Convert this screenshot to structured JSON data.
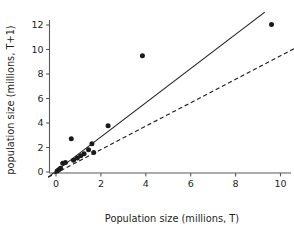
{
  "chart_data": {
    "type": "scatter",
    "title": "",
    "xlabel": "Population size (millions, T)",
    "ylabel": "population size (millions, T+1)",
    "xlim": [
      -0.6,
      10.9
    ],
    "ylim": [
      -0.7,
      13.2
    ],
    "xticks": [
      0,
      2,
      4,
      6,
      8,
      10
    ],
    "xtick_labels": [
      "0",
      "2",
      "4",
      "6",
      "8",
      "10"
    ],
    "yticks": [
      0,
      2,
      4,
      6,
      8,
      10,
      12
    ],
    "ytick_labels": [
      "0",
      "2",
      "4",
      "6",
      "8",
      "10",
      "12"
    ],
    "grid": false,
    "legend": "none",
    "points": [
      {
        "x": 0.05,
        "y": 0.08
      },
      {
        "x": 0.12,
        "y": 0.18
      },
      {
        "x": 0.2,
        "y": 0.3
      },
      {
        "x": 0.3,
        "y": 0.72
      },
      {
        "x": 0.42,
        "y": 0.78
      },
      {
        "x": 0.68,
        "y": 2.72
      },
      {
        "x": 0.78,
        "y": 0.95
      },
      {
        "x": 0.95,
        "y": 1.15
      },
      {
        "x": 1.1,
        "y": 1.32
      },
      {
        "x": 1.25,
        "y": 1.5
      },
      {
        "x": 1.45,
        "y": 1.82
      },
      {
        "x": 1.6,
        "y": 2.3
      },
      {
        "x": 1.68,
        "y": 1.6
      },
      {
        "x": 2.32,
        "y": 3.78
      },
      {
        "x": 3.85,
        "y": 9.5
      },
      {
        "x": 9.6,
        "y": 12.05
      }
    ],
    "lines": [
      {
        "name": "fitted-regression-line",
        "style": "solid",
        "x_start": -0.35,
        "y_start": -0.42,
        "x_end": 9.3,
        "y_end": 13.05
      },
      {
        "name": "replacement-reference-line",
        "style": "dashed",
        "x_start": -0.35,
        "y_start": -0.42,
        "x_end": 10.75,
        "y_end": 10.2
      }
    ]
  }
}
